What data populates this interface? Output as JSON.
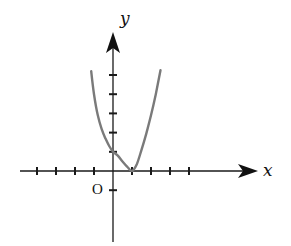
{
  "chart_data": {
    "type": "line",
    "title": "",
    "xlabel": "x",
    "ylabel": "y",
    "origin_label": "O",
    "xlim": [
      -5,
      8
    ],
    "ylim": [
      -3.6,
      7.2
    ],
    "grid": false,
    "legend": null,
    "x_ticks": [
      -4,
      -3,
      -2,
      -1,
      1,
      2,
      3,
      4
    ],
    "y_ticks": [
      -1,
      1,
      2,
      3,
      4,
      5
    ],
    "tick_labels_shown": false,
    "series": [
      {
        "name": "curve",
        "color": "#7a7a7a",
        "description": "piecewise curve: left branch descends from upper-left to (0,1), segment from (0,1) to minimum at (1,0), right branch rises steeply",
        "points": [
          [
            -1.15,
            5.2
          ],
          [
            -1.0,
            4.0
          ],
          [
            -0.8,
            2.9
          ],
          [
            -0.6,
            2.2
          ],
          [
            -0.4,
            1.7
          ],
          [
            -0.2,
            1.3
          ],
          [
            0.0,
            1.0
          ],
          [
            0.25,
            0.8
          ],
          [
            0.5,
            0.5
          ],
          [
            0.75,
            0.22
          ],
          [
            1.0,
            0.0
          ],
          [
            1.25,
            0.35
          ],
          [
            1.5,
            1.1
          ],
          [
            1.75,
            1.95
          ],
          [
            2.0,
            2.9
          ],
          [
            2.25,
            4.0
          ],
          [
            2.5,
            5.25
          ]
        ]
      }
    ],
    "annotations": [
      {
        "text": "O",
        "position": "below-left of origin"
      }
    ]
  },
  "colors": {
    "axis": "#1a1a1a",
    "curve": "#7a7a7a",
    "background": "#ffffff"
  }
}
